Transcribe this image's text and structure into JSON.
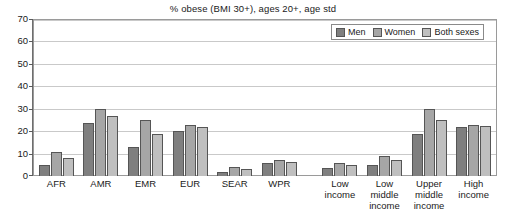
{
  "chart_data": {
    "type": "bar",
    "title": "% obese (BMI 30+), ages 20+, age std",
    "xlabel": "",
    "ylabel": "",
    "ylim": [
      0,
      70
    ],
    "yticks": [
      0,
      10,
      20,
      30,
      40,
      50,
      60,
      70
    ],
    "grid": true,
    "legend_position": "top-right",
    "categories": [
      "AFR",
      "AMR",
      "EMR",
      "EUR",
      "SEAR",
      "WPR",
      "Low income",
      "Low middle income",
      "Upper middle income",
      "High income"
    ],
    "category_lines": [
      [
        "AFR"
      ],
      [
        "AMR"
      ],
      [
        "EMR"
      ],
      [
        "EUR"
      ],
      [
        "SEAR"
      ],
      [
        "WPR"
      ],
      [
        "Low",
        "income"
      ],
      [
        "Low",
        "middle",
        "income"
      ],
      [
        "Upper",
        "middle",
        "income"
      ],
      [
        "High",
        "income"
      ]
    ],
    "series": [
      {
        "name": "Men",
        "color": "#7f7f7f",
        "values": [
          5,
          24,
          13,
          20,
          2,
          6,
          3.5,
          5,
          19,
          22
        ]
      },
      {
        "name": "Women",
        "color": "#a6a6a6",
        "values": [
          11,
          30,
          25,
          23,
          4,
          7,
          6,
          9,
          30,
          23
        ]
      },
      {
        "name": "Both sexes",
        "color": "#bfbfbf",
        "values": [
          8,
          27,
          19,
          22,
          3,
          6.5,
          5,
          7,
          25,
          22.5
        ]
      }
    ]
  }
}
